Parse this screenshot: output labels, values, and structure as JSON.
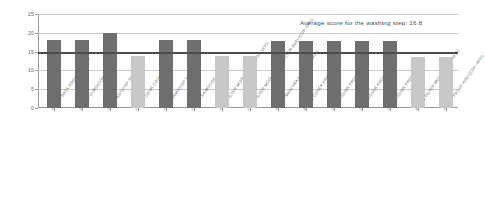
{
  "chart_data": {
    "type": "bar",
    "title": "",
    "xlabel": "",
    "ylabel": "",
    "ylim": [
      0,
      25
    ],
    "yticks": [
      0,
      5,
      10,
      15,
      20,
      25
    ],
    "ytick_labels": [
      "0",
      "5",
      "10",
      "15",
      "20",
      "25"
    ],
    "grid": true,
    "legend": "none",
    "categories": [
      "COVER BACK ASSY(COP-3400)",
      "POWER CORD(COP-3435)",
      "TANK ASSY(COP-3400)",
      "COVER GEAR COOKING FAN",
      "CASE SAMP(COP-3400)",
      "COVER SAMP(COP-3400)",
      "CASE FILTER MODULE ASSY(COP-3470)",
      "CASE FILTER MODULE CONNECTOR ASSY(COP-3470)",
      "COVER MAIN PBA ASSY(COP-3400)",
      "FRAME COVER FRONT",
      "DECO COVER FRONT UPPER",
      "DECO COVER FRONT LOWER",
      "DECO COVER FRONT MIDDLE",
      "FRAME FILTER MODULE(COP-3435)",
      "COVER FRONT ASSY(COP-3400)"
    ],
    "values": [
      18.0,
      18.0,
      20.0,
      13.8,
      18.0,
      18.0,
      13.8,
      13.8,
      17.8,
      17.8,
      17.8,
      17.8,
      17.8,
      13.5,
      13.5
    ],
    "bar_styles": [
      "dark",
      "dark",
      "dark",
      "light",
      "dark",
      "dark",
      "light",
      "light",
      "dark",
      "dark",
      "dark",
      "dark",
      "dark",
      "light",
      "light"
    ],
    "colors": {
      "dark": "#6e6e6e",
      "light": "#c8c8c8",
      "reference_line": "#4d4d4d",
      "grid": "#c9c9c9",
      "axis": "#9a9a9a",
      "text": "#5a5a5a"
    },
    "reference_line": {
      "value": 15,
      "label": ""
    },
    "annotations": [
      {
        "text": "Average  score for the washing  step:  16.8",
        "value": 16.8
      }
    ]
  }
}
